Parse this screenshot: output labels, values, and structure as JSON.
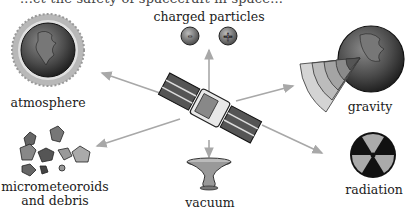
{
  "caption_partial": "...ct the safety of spacecraft in space...",
  "center": {
    "label": "satellite"
  },
  "factors": [
    {
      "id": "charged-particles",
      "label": "charged particles",
      "symbols": [
        "-",
        "+"
      ]
    },
    {
      "id": "atmosphere",
      "label": "atmosphere"
    },
    {
      "id": "gravity",
      "label": "gravity"
    },
    {
      "id": "micrometeoroids",
      "label_line1": "micrometeoroids",
      "label_line2": "and debris"
    },
    {
      "id": "vacuum",
      "label": "vacuum"
    },
    {
      "id": "radiation",
      "label": "radiation"
    }
  ],
  "colors": {
    "arrow": "#a8a8a8",
    "earth_dark": "#2a2a2a",
    "earth_mid": "#6a6a6a",
    "panel": "#555555"
  }
}
